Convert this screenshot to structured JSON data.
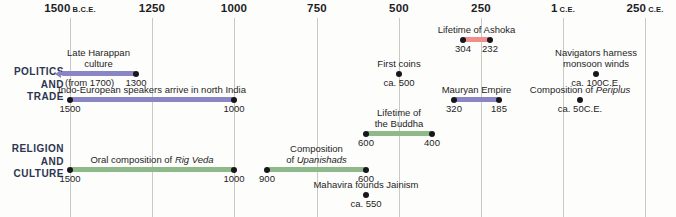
{
  "axis": {
    "ticks": [
      {
        "label": "1500",
        "era": "B.C.E.",
        "x": 70
      },
      {
        "label": "1250",
        "era": "",
        "x": 152
      },
      {
        "label": "1000",
        "era": "",
        "x": 234
      },
      {
        "label": "750",
        "era": "",
        "x": 317
      },
      {
        "label": "500",
        "era": "",
        "x": 399
      },
      {
        "label": "250",
        "era": "",
        "x": 481
      },
      {
        "label": "1",
        "era": "C.E.",
        "x": 563
      },
      {
        "label": "250",
        "era": "C.E.",
        "x": 645
      }
    ]
  },
  "categories": [
    {
      "id": "politics",
      "lines": [
        "POLITICS",
        "AND",
        "TRADE"
      ],
      "color": "#8a86c4",
      "top": 66
    },
    {
      "id": "religion",
      "lines": [
        "RELIGION",
        "AND",
        "CULTURE"
      ],
      "color": "#8fb98a",
      "top": 143
    }
  ],
  "events": [
    {
      "id": "lifetime-of-ashoka",
      "title": "Lifetime of Ashoka",
      "kind": "bar",
      "color": "red",
      "x1": 463,
      "x2": 490,
      "y": 37,
      "open_left": false,
      "start_label": "304",
      "end_label": "232"
    },
    {
      "id": "late-harappan-culture",
      "title": "Late Harappan\nculture",
      "kind": "bar",
      "color": "purple",
      "x1": 61,
      "x2": 136,
      "y": 71,
      "open_left": true,
      "start_label": "(from 1700)",
      "end_label": "1300"
    },
    {
      "id": "first-coins",
      "title": "First coins",
      "kind": "point",
      "x": 399,
      "y": 71,
      "date_label": "ca. 500"
    },
    {
      "id": "navigators-harness-monsoon-winds",
      "title": "Navigators harness\nmonsoon winds",
      "kind": "point",
      "x": 596,
      "y": 71,
      "date_label": "ca. 100",
      "date_era": "C.E."
    },
    {
      "id": "indo-european-speakers",
      "title": "Indo-European speakers arrive in north India",
      "kind": "bar",
      "color": "purple",
      "x1": 70,
      "x2": 234,
      "y": 97,
      "open_left": false,
      "start_label": "1500",
      "end_label": "1000"
    },
    {
      "id": "mauryan-empire",
      "title": "Mauryan Empire",
      "kind": "bar",
      "color": "purple",
      "x1": 454,
      "x2": 499,
      "y": 97,
      "open_left": false,
      "start_label": "320",
      "end_label": "185"
    },
    {
      "id": "composition-of-periplus",
      "title": "Composition of |Periplus|",
      "kind": "point",
      "x": 580,
      "y": 97,
      "date_label": "ca. 50",
      "date_era": "C.E."
    },
    {
      "id": "lifetime-of-the-buddha",
      "title": "Lifetime of\nthe Buddha",
      "kind": "bar",
      "color": "green",
      "x1": 366,
      "x2": 432,
      "y": 131,
      "open_left": false,
      "start_label": "600",
      "end_label": "400"
    },
    {
      "id": "oral-composition-of-rig-veda",
      "title": "Oral composition of |Rig Veda|",
      "kind": "bar",
      "color": "green",
      "x1": 70,
      "x2": 234,
      "y": 167,
      "open_left": false,
      "start_label": "1500",
      "end_label": "1000"
    },
    {
      "id": "composition-of-upanishads",
      "title": "Composition\nof |Upanishads|",
      "kind": "bar",
      "color": "green",
      "x1": 267,
      "x2": 366,
      "y": 167,
      "open_left": false,
      "start_label": "900",
      "end_label": "600"
    },
    {
      "id": "mahavira-founds-jainism",
      "title": "Mahavira founds Jainism",
      "kind": "point",
      "x": 366,
      "y": 192,
      "date_label": "ca. 550"
    }
  ]
}
